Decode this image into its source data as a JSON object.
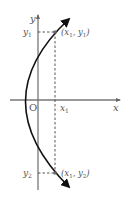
{
  "diagram": {
    "type": "parabola-graph",
    "axes": {
      "x_label": "x",
      "y_label": "y",
      "origin_label": "O"
    },
    "ticks": {
      "x1": "x",
      "x1_sub": "1",
      "y1": "y",
      "y1_sub": "1",
      "y2": "y",
      "y2_sub": "2"
    },
    "points": [
      {
        "label_open": "(x",
        "sub1": "1",
        "mid": ", y",
        "sub2": "1",
        "close": ")"
      },
      {
        "label_open": "(x",
        "sub1": "1",
        "mid": ", y",
        "sub2": "2",
        "close": ")"
      }
    ],
    "colors": {
      "curve": "#111111",
      "axes": "#666666",
      "dashed": "#444444",
      "text": "#555555"
    }
  }
}
